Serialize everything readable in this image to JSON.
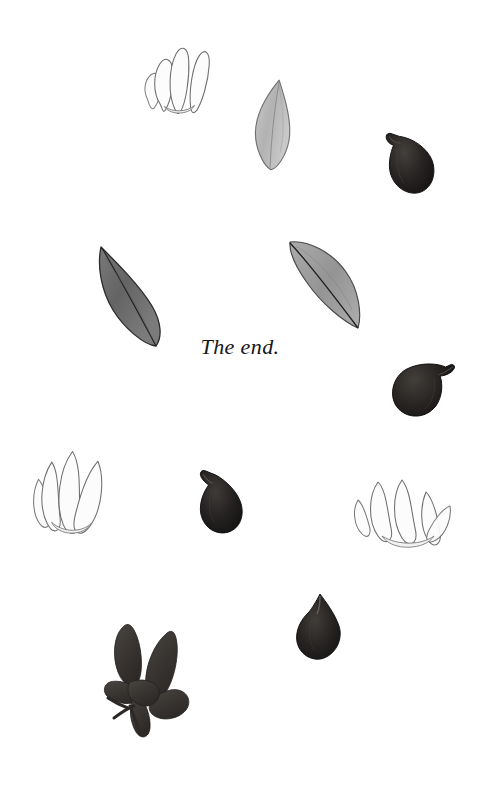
{
  "page": {
    "width": 480,
    "height": 795,
    "background_color": "#ffffff",
    "kind": "illustrated-book-end-page"
  },
  "text": {
    "end_note": "The end."
  },
  "palette": {
    "background": "#ffffff",
    "text": "#16161a",
    "fig_dark": "#1d1b1a",
    "fig_dark_mid": "#332f2d",
    "fig_highlight": "#57524e",
    "leaf_dark": "#6a6a6a",
    "leaf_dark_edge": "#2b2b2b",
    "leaf_light": "#b8b8b8",
    "leaf_light_edge": "#6f6f6f",
    "petal_fill": "#fbfbfb",
    "petal_outline": "#6e6e6e",
    "leaf_silhouette": "#3a3836"
  },
  "specimens": [
    {
      "id": "flower-cluster-top",
      "name": "white-flower-cluster",
      "kind": "flower",
      "tone": "pale",
      "x": 138,
      "y": 42,
      "width": 76,
      "height": 78,
      "rotation": -6,
      "petals": 4
    },
    {
      "id": "leaf-light-top",
      "name": "light-leaf-upright",
      "kind": "leaf",
      "tone": "light",
      "x": 248,
      "y": 78,
      "width": 50,
      "height": 90,
      "rotation": 4
    },
    {
      "id": "fig-top-right",
      "name": "dark-fig-fruit",
      "kind": "fig",
      "tone": "dark",
      "x": 383,
      "y": 126,
      "width": 52,
      "height": 68,
      "rotation": -8,
      "stem": "top-left"
    },
    {
      "id": "leaf-dark-left",
      "name": "dark-leaf-diagonal",
      "kind": "leaf",
      "tone": "dark",
      "x": 92,
      "y": 242,
      "width": 86,
      "height": 106,
      "rotation": 0
    },
    {
      "id": "leaf-mid-right",
      "name": "gray-leaf-diagonal",
      "kind": "leaf",
      "tone": "mid",
      "x": 282,
      "y": 234,
      "width": 82,
      "height": 96,
      "rotation": 0
    },
    {
      "id": "fig-mid-right",
      "name": "dark-fig-fruit",
      "kind": "fig",
      "tone": "dark",
      "x": 390,
      "y": 352,
      "width": 60,
      "height": 66,
      "rotation": 14,
      "stem": "top-right"
    },
    {
      "id": "flower-cluster-left",
      "name": "white-flower-cluster",
      "kind": "flower",
      "tone": "pale",
      "x": 30,
      "y": 434,
      "width": 92,
      "height": 104,
      "rotation": 4,
      "petals": 4
    },
    {
      "id": "fig-center",
      "name": "dark-fig-fruit",
      "kind": "fig",
      "tone": "dark",
      "x": 192,
      "y": 466,
      "width": 54,
      "height": 68,
      "rotation": -4,
      "stem": "top-left"
    },
    {
      "id": "flower-cluster-right",
      "name": "white-flower-fan-cluster",
      "kind": "flower",
      "tone": "pale",
      "x": 352,
      "y": 470,
      "width": 102,
      "height": 82,
      "rotation": 0,
      "petals": 5
    },
    {
      "id": "fig-bottom",
      "name": "dark-fig-fruit",
      "kind": "fig",
      "tone": "dark",
      "x": 290,
      "y": 592,
      "width": 56,
      "height": 66,
      "rotation": 0,
      "stem": "top-center"
    },
    {
      "id": "fig-leaf-silhouette",
      "name": "dark-fig-leaf-silhouette",
      "kind": "lobed-leaf",
      "tone": "dark",
      "x": 100,
      "y": 614,
      "width": 104,
      "height": 122,
      "rotation": 0,
      "lobes": 5
    }
  ]
}
